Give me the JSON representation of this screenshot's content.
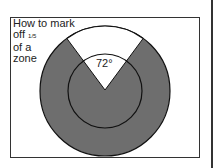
{
  "caption": {
    "line1": "How to mark",
    "line2_prefix": "off ",
    "line2_fraction": "1/5",
    "line3": "of a",
    "line4": "zone"
  },
  "angle_label": "72°",
  "colors": {
    "shaded": "#6e6e6e",
    "outline": "#111111",
    "background": "#ffffff"
  },
  "geometry": {
    "outer_radius": 65,
    "inner_radius": 37,
    "wedge_angle_deg": 72
  }
}
